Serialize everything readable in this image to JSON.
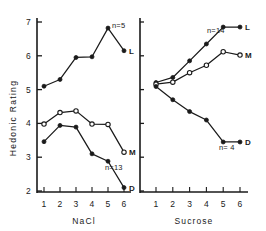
{
  "figure": {
    "ylabel": "Hedonic Rating",
    "y_ticks": [
      "7",
      "6",
      "5",
      "4",
      "3",
      "2"
    ],
    "y_values": [
      7,
      6,
      5,
      4,
      3,
      2
    ],
    "ylim": [
      2,
      7
    ],
    "x_ticks": [
      "1",
      "2",
      "3",
      "4",
      "5",
      "6"
    ],
    "x_values": [
      1,
      2,
      3,
      4,
      5,
      6
    ]
  },
  "panels": [
    {
      "id": "nacl",
      "xlabel": "NaCl",
      "series": [
        {
          "name": "L",
          "label": "L",
          "n_label": "n=5",
          "marker": "filled",
          "values": [
            5.1,
            5.3,
            5.95,
            5.97,
            6.82,
            6.15
          ]
        },
        {
          "name": "M",
          "label": "M",
          "n_label": "",
          "marker": "open",
          "values": [
            3.98,
            4.32,
            4.37,
            3.98,
            3.97,
            3.15
          ]
        },
        {
          "name": "D",
          "label": "D",
          "n_label": "n=13",
          "marker": "filled",
          "values": [
            3.46,
            3.94,
            3.89,
            3.1,
            2.88,
            2.1
          ]
        }
      ]
    },
    {
      "id": "sucrose",
      "xlabel": "Sucrose",
      "series": [
        {
          "name": "L",
          "label": "L",
          "n_label": "n=14",
          "marker": "filled",
          "values": [
            5.21,
            5.36,
            5.85,
            6.35,
            6.85,
            6.85
          ]
        },
        {
          "name": "M",
          "label": "M",
          "n_label": "",
          "marker": "open",
          "values": [
            5.16,
            5.22,
            5.5,
            5.72,
            6.12,
            6.02
          ]
        },
        {
          "name": "D",
          "label": "D",
          "n_label": "n= 4",
          "marker": "filled",
          "values": [
            5.09,
            4.7,
            4.35,
            4.1,
            3.45,
            3.45
          ]
        }
      ]
    }
  ],
  "chart_data": {
    "type": "line",
    "title": "",
    "subtitle": "",
    "xlabel": "Concentration step",
    "ylabel": "Hedonic Rating",
    "ylim": [
      2,
      7
    ],
    "xlim": [
      1,
      6
    ],
    "grid": false,
    "legend": "inline-right-labels",
    "x": [
      1,
      2,
      3,
      4,
      5,
      6
    ],
    "x_tick_labels": [
      "1",
      "2",
      "3",
      "4",
      "5",
      "6"
    ],
    "y_tick_labels": [
      "2",
      "3",
      "4",
      "5",
      "6",
      "7"
    ],
    "panels": [
      {
        "panel": "NaCl",
        "xlabel": "NaCl",
        "series": [
          {
            "name": "L",
            "n": 5,
            "marker": "filled-circle",
            "values": [
              5.1,
              5.3,
              5.95,
              5.97,
              6.82,
              6.15
            ]
          },
          {
            "name": "M",
            "n": null,
            "marker": "open-circle",
            "values": [
              3.98,
              4.32,
              4.37,
              3.98,
              3.97,
              3.15
            ]
          },
          {
            "name": "D",
            "n": 13,
            "marker": "filled-circle",
            "values": [
              3.46,
              3.94,
              3.89,
              3.1,
              2.88,
              2.1
            ]
          }
        ]
      },
      {
        "panel": "Sucrose",
        "xlabel": "Sucrose",
        "series": [
          {
            "name": "L",
            "n": 14,
            "marker": "filled-circle",
            "values": [
              5.21,
              5.36,
              5.85,
              6.35,
              6.85,
              6.85
            ]
          },
          {
            "name": "M",
            "n": null,
            "marker": "open-circle",
            "values": [
              5.16,
              5.22,
              5.5,
              5.72,
              6.12,
              6.02
            ]
          },
          {
            "name": "D",
            "n": 4,
            "marker": "filled-circle",
            "values": [
              5.09,
              4.7,
              4.35,
              4.1,
              3.45,
              3.45
            ]
          }
        ]
      }
    ]
  }
}
